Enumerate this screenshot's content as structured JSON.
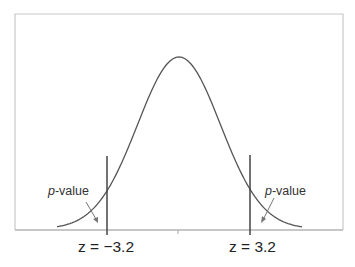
{
  "diagram": {
    "labels": {
      "left_p": {
        "italic": "p",
        "rest": "-value"
      },
      "right_p": {
        "italic": "p",
        "rest": "-value"
      },
      "left_z": "z = −3.2",
      "right_z": "z = 3.2"
    },
    "colors": {
      "curve": "#555555",
      "lines": "#444444",
      "frame": "#c8c8c8"
    }
  },
  "chart_data": {
    "type": "line",
    "title": "",
    "xlabel": "",
    "ylabel": "",
    "distribution": "normal",
    "mean": 0,
    "critical_values": [
      -3.2,
      3.2
    ],
    "annotations": [
      {
        "text": "p-value",
        "position": "left tail",
        "points_to": "area left of z = -3.2"
      },
      {
        "text": "p-value",
        "position": "right tail",
        "points_to": "area right of z = 3.2"
      },
      {
        "text": "z = −3.2",
        "position": "below axis at left line"
      },
      {
        "text": "z = 3.2",
        "position": "below axis at right line"
      }
    ],
    "grid": false,
    "legend": null
  }
}
